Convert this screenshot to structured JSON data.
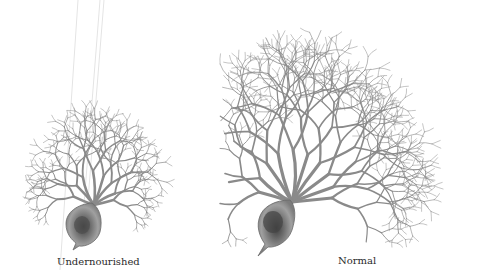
{
  "figure": {
    "panels": [
      {
        "id": "undernourished",
        "label": "Undernourished"
      },
      {
        "id": "normal",
        "label": "Normal"
      }
    ]
  },
  "colors": {
    "background": "#ffffff",
    "dendrite": "#8a8a8a",
    "dendrite_dark": "#6e6e6e",
    "soma": "#8c8c8c",
    "nucleus": "#4a4a4a",
    "label": "#2a2a2a"
  }
}
